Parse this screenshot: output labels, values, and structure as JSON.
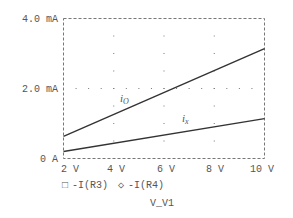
{
  "chart_data": {
    "type": "line",
    "title": "",
    "xlabel": "V_V1",
    "ylabel": "",
    "xlim": [
      2,
      10
    ],
    "ylim": [
      0,
      4.0
    ],
    "x_ticks": [
      "2 V",
      "4 V",
      "6 V",
      "8 V",
      "10 V"
    ],
    "y_ticks": [
      "0 A",
      "2.0 mA",
      "4.0 mA"
    ],
    "grid": "dotted",
    "x": [
      2,
      10
    ],
    "series": [
      {
        "name": "-I(R3)",
        "marker": "square",
        "annotation": "i_O",
        "values_mA": [
          0.63,
          3.14
        ]
      },
      {
        "name": "-I(R4)",
        "marker": "diamond",
        "annotation": "i_x",
        "values_mA": [
          0.2,
          1.14
        ]
      }
    ],
    "legend_position": "bottom"
  },
  "legend": {
    "items": [
      {
        "marker": "□",
        "label": "-I(R3)"
      },
      {
        "marker": "◇",
        "label": "-I(R4)"
      }
    ]
  },
  "annotations": {
    "io_main": "i",
    "io_sub": "O",
    "ix_main": "i",
    "ix_sub": "x"
  },
  "colors": {
    "line": "#333333",
    "grid": "#777777",
    "text": "#555555"
  }
}
